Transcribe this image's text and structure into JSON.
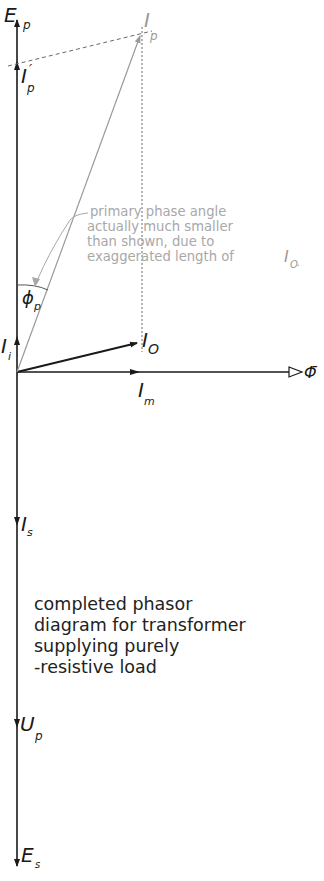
{
  "diagram": {
    "title": "completed phasor diagram for transformer supplying purely -resistive load",
    "caption_lines": [
      "completed phasor",
      "diagram for transformer",
      "supplying purely",
      "-resistive load"
    ],
    "annotation_lines": [
      "primary phase angle",
      "actually much smaller",
      "than shown, due to",
      "exaggerated length of"
    ],
    "annotation_tail": {
      "main": "I",
      "sub": "O",
      "end": "."
    },
    "labels": {
      "E_p": {
        "main": "E",
        "sub": "p"
      },
      "I_p_prime": {
        "main": "I",
        "sub": "p",
        "mark": "′"
      },
      "I_p": {
        "main": "I",
        "sub": "p"
      },
      "phi_p": {
        "main": "ϕ",
        "sub": "p"
      },
      "I_i": {
        "main": "I",
        "sub": "i"
      },
      "I_O": {
        "main": "I",
        "sub": "O"
      },
      "I_m": {
        "main": "I",
        "sub": "m"
      },
      "Phi": {
        "main": "Φ̄"
      },
      "I_s": {
        "main": "I",
        "sub": "s"
      },
      "U_p": {
        "main": "U",
        "sub": "p"
      },
      "E_s": {
        "main": "E",
        "sub": "s"
      }
    },
    "colors": {
      "ink": "#1a1a1a",
      "construction": "#8c8c8c",
      "annotation": "#a8a8a8"
    }
  }
}
